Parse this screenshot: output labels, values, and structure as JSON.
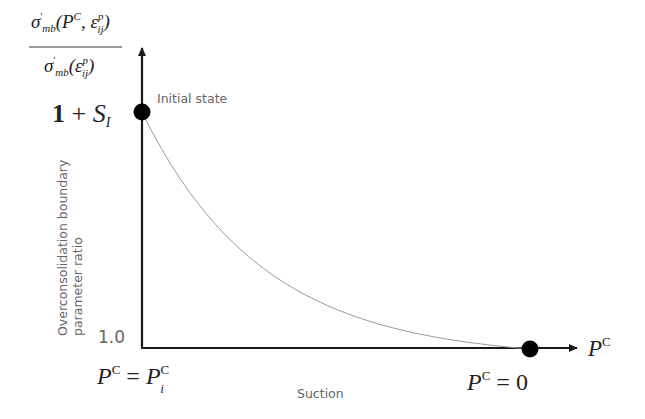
{
  "diagram": {
    "type": "line",
    "y_axis_fraction": {
      "numerator": "σ'mb(P^C, ε^p_ij)",
      "denominator": "σ'mb(ε^p_ij)"
    },
    "y_axis_label_line1": "Overconsolidation boundary",
    "y_axis_label_line2": "parameter ratio",
    "x_axis_label": "Suction",
    "x_axis_symbol": "P^C",
    "y_tick_top": "1 + S_I",
    "y_tick_bottom": "1.0",
    "x_tick_left": "P^C = P^C_i",
    "x_tick_right": "P^C = 0",
    "annotation": "Initial state",
    "points": [
      {
        "name": "initial-state",
        "x_label": "P^C = P^C_i",
        "y_label": "1 + S_I"
      },
      {
        "name": "final-state",
        "x_label": "P^C = 0",
        "y_label": "1.0"
      }
    ],
    "curve": "monotonically decreasing, convex, from (P^C_i, 1+S_I) to (0, 1.0)",
    "colors": {
      "axis": "#1a1a1a",
      "curve": "#9a9a9a",
      "marker": "#000000",
      "label": "#666666"
    }
  }
}
